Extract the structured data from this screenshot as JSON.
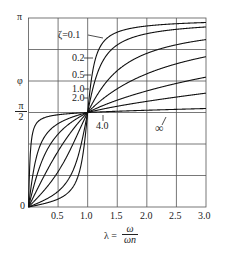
{
  "chart_data": {
    "type": "line",
    "title": "",
    "xlabel": "λ = ω / ωn",
    "xlabel_parts": {
      "lhs": "λ =",
      "num": "ω",
      "den": "ωn"
    },
    "ylabel": "φ",
    "xlim": [
      0,
      3.0
    ],
    "ylim": [
      0,
      3.14159
    ],
    "x_ticks": [
      "0.5",
      "1.0",
      "1.5",
      "2.0",
      "2.5",
      "3.0"
    ],
    "x_tick_values": [
      0.5,
      1.0,
      1.5,
      2.0,
      2.5,
      3.0
    ],
    "y_ticks": [
      {
        "label": "π",
        "value": 3.14159
      },
      {
        "label": "φ",
        "value": 2.0944
      },
      {
        "label": "π/2",
        "value": 1.5708
      },
      {
        "label": "0",
        "value": 0
      }
    ],
    "grid": true,
    "grid_x": [
      0.5,
      1.0,
      1.5,
      2.0,
      2.5
    ],
    "grid_y_divisions": 6,
    "formula": "φ = atan2(2ζλ, 1 − λ²)",
    "series": [
      {
        "name": "ζ=0.1",
        "zeta": 0.1,
        "label": "ζ=0.1"
      },
      {
        "name": "ζ=0.2",
        "zeta": 0.2,
        "label": "0.2"
      },
      {
        "name": "ζ=0.5",
        "zeta": 0.5,
        "label": "0.5"
      },
      {
        "name": "ζ=1.0",
        "zeta": 1.0,
        "label": "1.0"
      },
      {
        "name": "ζ=2.0",
        "zeta": 2.0,
        "label": "2.0"
      },
      {
        "name": "ζ=4.0",
        "zeta": 4.0,
        "label": "4.0"
      },
      {
        "name": "ζ=∞",
        "zeta": "inf",
        "label": "∞"
      }
    ],
    "sample_values_at_lambda_3": {
      "ζ=0.1": 3.067,
      "ζ=0.2": 2.992,
      "ζ=0.5": 2.783,
      "ζ=1.0": 2.498,
      "ζ=2.0": 2.159,
      "ζ=4.0": 1.893
    }
  },
  "labels": {
    "zeta01": "ζ=0.1",
    "zeta02": "0.2",
    "zeta05": "0.5",
    "zeta10": "1.0",
    "zeta20": "2.0",
    "zeta40": "4.0",
    "zetaInf": "∞",
    "y_pi": "π",
    "y_phi": "φ",
    "y_half_num": "π",
    "y_half_den": "2",
    "y_zero": "0",
    "x_lhs": "λ =",
    "x_num": "ω",
    "x_den": "ωn",
    "xt1": "0.5",
    "xt2": "1.0",
    "xt3": "1.5",
    "xt4": "2.0",
    "xt5": "2.5",
    "xt6": "3.0"
  }
}
